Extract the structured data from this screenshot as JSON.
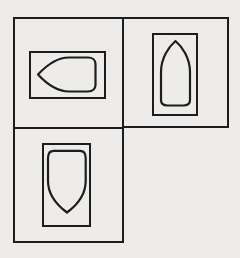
{
  "figure": {
    "background_color": "#edecea",
    "stroke_color": "#1d1d1d",
    "box_stroke_width": 2,
    "shape_stroke_width": 2.2,
    "cells": [
      {
        "id": "top-left",
        "outer_box": {
          "x": 14,
          "y": 18,
          "w": 109,
          "h": 110
        },
        "inner_box": {
          "x": 30,
          "y": 52,
          "w": 75,
          "h": 46
        },
        "shape": {
          "kind": "shield-bullet",
          "orientation": "left",
          "path": "M38,74.5 C44.5,67.5 55,57.5 69,57.5 L88,57.5 C92.5,57.5 95.5,60 95.5,64 L95.5,85 C95.5,89 92.5,91.5 88,91.5 L69,91.5 C55,91.5 44.5,81.5 38,74.5 Z"
        }
      },
      {
        "id": "top-right",
        "outer_box": {
          "x": 123,
          "y": 18,
          "w": 105,
          "h": 109
        },
        "inner_box": {
          "x": 153,
          "y": 34,
          "w": 44,
          "h": 81
        },
        "shape": {
          "kind": "shield-bullet",
          "orientation": "up",
          "path": "M175.5,41 C169,46.5 161,58 161,72 L161,100 C161,103.5 163.5,105.5 167.5,105.5 L183.5,105.5 C187.5,105.5 190,103.5 190,100 L190,72 C190,58 182,46.5 175.5,41 Z"
        }
      },
      {
        "id": "bottom-left",
        "outer_box": {
          "x": 14,
          "y": 128,
          "w": 109,
          "h": 114
        },
        "inner_box": {
          "x": 43,
          "y": 144,
          "w": 47,
          "h": 82
        },
        "shape": {
          "kind": "shield-bullet",
          "orientation": "down",
          "path": "M48,158 C48,153.5 49.5,150.8 53.8,150.8 L80,150.8 C84.2,150.8 85.7,153.5 85.7,158 L85.7,181 C85.7,193 78.5,204 67,212.5 C55.5,204 48,193 48,181 Z"
        }
      }
    ]
  }
}
